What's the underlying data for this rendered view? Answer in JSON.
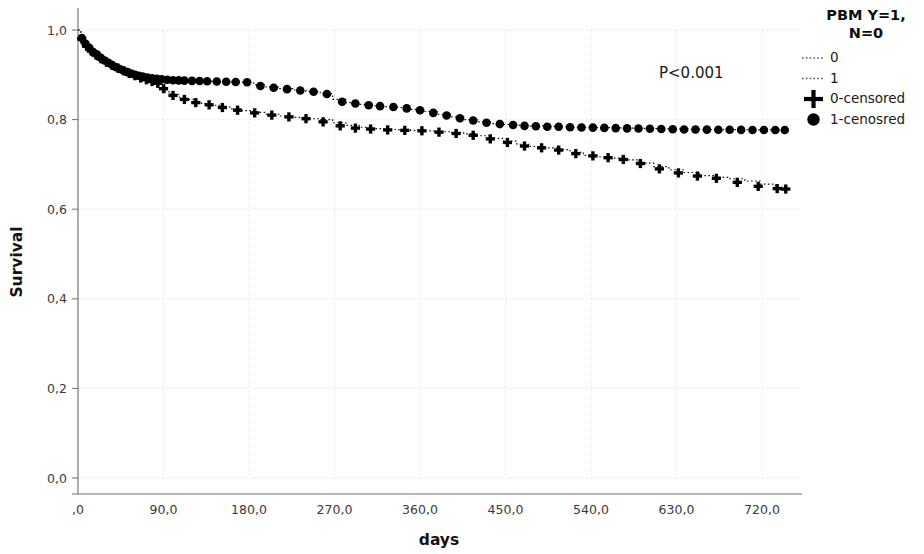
{
  "figure": {
    "width": 924,
    "height": 554,
    "background": "#ffffff",
    "annotation": {
      "pvalue": "P<0.001"
    }
  },
  "legend": {
    "title_line1": "PBM Y=1,",
    "title_line2": "N=0",
    "items": [
      {
        "label": "0",
        "marker": "dotted-line"
      },
      {
        "label": "1",
        "marker": "dotted-line"
      },
      {
        "label": "0-censored",
        "marker": "plus"
      },
      {
        "label": "1-cenosred",
        "marker": "circle"
      }
    ]
  },
  "chart_data": {
    "type": "line",
    "title": "",
    "subtitle": "",
    "xlabel": "days",
    "ylabel": "Survival",
    "xlim": [
      0,
      760
    ],
    "ylim": [
      0.0,
      1.0
    ],
    "grid": true,
    "legend_position": "right",
    "annotations": [
      {
        "text": "P<0.001",
        "x": 480,
        "y": 0.845
      }
    ],
    "xticks": [
      0,
      90,
      180,
      270,
      360,
      450,
      540,
      630,
      720
    ],
    "xticklabels": [
      ",0",
      "90,0",
      "180,0",
      "270,0",
      "360,0",
      "450,0",
      "540,0",
      "630,0",
      "720,0"
    ],
    "yticks": [
      0.0,
      0.2,
      0.4,
      0.6,
      0.8,
      1.0
    ],
    "yticklabels": [
      "0,0",
      "0,2",
      "0,4",
      "0,6",
      "0,8",
      "1,0"
    ],
    "series": [
      {
        "name": "1",
        "marker": "circle",
        "censored_label": "1-cenosred",
        "x": [
          0,
          3,
          6,
          9,
          12,
          15,
          18,
          21,
          25,
          29,
          33,
          37,
          41,
          45,
          49,
          53,
          57,
          61,
          66,
          71,
          76,
          81,
          86,
          92,
          98,
          104,
          110,
          118,
          126,
          134,
          142,
          152,
          162,
          172,
          185,
          198,
          212,
          226,
          240,
          255,
          268,
          282,
          296,
          310,
          322,
          336,
          350,
          364,
          378,
          392,
          406,
          420,
          434,
          448,
          462,
          476,
          490,
          504,
          518,
          532,
          546,
          560,
          574,
          588,
          602,
          616,
          630,
          644,
          658,
          672,
          686,
          700,
          714,
          728,
          742
        ],
        "y": [
          1.0,
          0.985,
          0.974,
          0.965,
          0.957,
          0.95,
          0.944,
          0.938,
          0.932,
          0.927,
          0.922,
          0.917,
          0.913,
          0.909,
          0.906,
          0.903,
          0.9,
          0.898,
          0.896,
          0.894,
          0.892,
          0.891,
          0.89,
          0.889,
          0.888,
          0.8875,
          0.887,
          0.8865,
          0.886,
          0.8855,
          0.885,
          0.8845,
          0.884,
          0.8835,
          0.878,
          0.873,
          0.869,
          0.866,
          0.863,
          0.858,
          0.845,
          0.838,
          0.834,
          0.831,
          0.829,
          0.827,
          0.823,
          0.818,
          0.812,
          0.806,
          0.8,
          0.795,
          0.791,
          0.789,
          0.787,
          0.786,
          0.785,
          0.784,
          0.783,
          0.7825,
          0.782,
          0.7815,
          0.781,
          0.7805,
          0.78,
          0.7795,
          0.779,
          0.7785,
          0.778,
          0.7778,
          0.7776,
          0.7774,
          0.7772,
          0.777,
          0.7768
        ]
      },
      {
        "name": "0",
        "marker": "plus",
        "censored_label": "0-censored",
        "x": [
          0,
          3,
          6,
          9,
          12,
          15,
          18,
          21,
          25,
          29,
          33,
          37,
          41,
          45,
          49,
          53,
          57,
          61,
          66,
          71,
          76,
          81,
          86,
          92,
          98,
          106,
          114,
          122,
          130,
          140,
          150,
          160,
          172,
          185,
          198,
          212,
          226,
          240,
          255,
          268,
          282,
          296,
          310,
          322,
          336,
          350,
          364,
          378,
          392,
          406,
          420,
          434,
          448,
          462,
          476,
          490,
          504,
          518,
          532,
          546,
          560,
          574,
          590,
          606,
          622,
          638,
          654,
          670,
          686,
          702,
          718,
          734,
          745
        ],
        "y": [
          1.0,
          0.984,
          0.972,
          0.963,
          0.955,
          0.948,
          0.942,
          0.936,
          0.93,
          0.925,
          0.92,
          0.915,
          0.911,
          0.907,
          0.904,
          0.901,
          0.898,
          0.895,
          0.892,
          0.889,
          0.886,
          0.883,
          0.88,
          0.862,
          0.856,
          0.85,
          0.845,
          0.84,
          0.836,
          0.832,
          0.828,
          0.824,
          0.82,
          0.816,
          0.812,
          0.808,
          0.805,
          0.802,
          0.8,
          0.793,
          0.787,
          0.783,
          0.78,
          0.778,
          0.777,
          0.776,
          0.775,
          0.773,
          0.771,
          0.768,
          0.764,
          0.758,
          0.752,
          0.745,
          0.74,
          0.737,
          0.733,
          0.727,
          0.72,
          0.717,
          0.714,
          0.71,
          0.703,
          0.695,
          0.688,
          0.682,
          0.675,
          0.671,
          0.668,
          0.663,
          0.656,
          0.649,
          0.645
        ]
      }
    ],
    "censor_marks": {
      "1": {
        "x": [
          4,
          8,
          12,
          16,
          20,
          24,
          28,
          32,
          36,
          40,
          44,
          48,
          52,
          56,
          60,
          64,
          68,
          73,
          78,
          83,
          88,
          94,
          100,
          106,
          112,
          120,
          128,
          136,
          146,
          156,
          166,
          178,
          192,
          206,
          220,
          234,
          248,
          262,
          278,
          292,
          306,
          318,
          332,
          346,
          360,
          374,
          388,
          402,
          416,
          430,
          444,
          458,
          470,
          482,
          494,
          506,
          518,
          530,
          542,
          554,
          566,
          578,
          590,
          602,
          614,
          626,
          638,
          650,
          662,
          674,
          686,
          698,
          710,
          722,
          734,
          744
        ],
        "y": [
          0.982,
          0.969,
          0.96,
          0.951,
          0.945,
          0.938,
          0.932,
          0.927,
          0.922,
          0.917,
          0.913,
          0.909,
          0.906,
          0.903,
          0.9,
          0.898,
          0.896,
          0.894,
          0.892,
          0.891,
          0.89,
          0.889,
          0.888,
          0.8875,
          0.887,
          0.8865,
          0.886,
          0.8855,
          0.885,
          0.8845,
          0.884,
          0.8835,
          0.875,
          0.871,
          0.868,
          0.865,
          0.862,
          0.857,
          0.84,
          0.836,
          0.832,
          0.83,
          0.828,
          0.825,
          0.821,
          0.815,
          0.809,
          0.803,
          0.798,
          0.793,
          0.79,
          0.788,
          0.786,
          0.785,
          0.784,
          0.784,
          0.783,
          0.7825,
          0.782,
          0.7815,
          0.781,
          0.7805,
          0.78,
          0.7795,
          0.779,
          0.7785,
          0.778,
          0.7778,
          0.7776,
          0.7774,
          0.7772,
          0.777,
          0.7769,
          0.7768,
          0.7768,
          0.7768
        ]
      },
      "0": {
        "x": [
          4,
          9,
          14,
          19,
          24,
          30,
          36,
          42,
          48,
          54,
          60,
          66,
          72,
          78,
          84,
          90,
          100,
          112,
          124,
          138,
          152,
          168,
          186,
          204,
          222,
          240,
          258,
          276,
          292,
          308,
          326,
          344,
          362,
          380,
          398,
          416,
          434,
          452,
          470,
          488,
          506,
          524,
          542,
          558,
          574,
          592,
          612,
          632,
          652,
          672,
          694,
          716,
          736,
          745
        ],
        "y": [
          0.98,
          0.964,
          0.953,
          0.944,
          0.936,
          0.928,
          0.921,
          0.915,
          0.909,
          0.903,
          0.898,
          0.893,
          0.889,
          0.885,
          0.881,
          0.869,
          0.854,
          0.845,
          0.838,
          0.833,
          0.827,
          0.821,
          0.815,
          0.81,
          0.806,
          0.802,
          0.795,
          0.786,
          0.781,
          0.779,
          0.777,
          0.776,
          0.775,
          0.772,
          0.769,
          0.765,
          0.757,
          0.749,
          0.741,
          0.737,
          0.732,
          0.724,
          0.719,
          0.715,
          0.711,
          0.702,
          0.69,
          0.681,
          0.674,
          0.669,
          0.66,
          0.651,
          0.646,
          0.645
        ]
      }
    }
  }
}
